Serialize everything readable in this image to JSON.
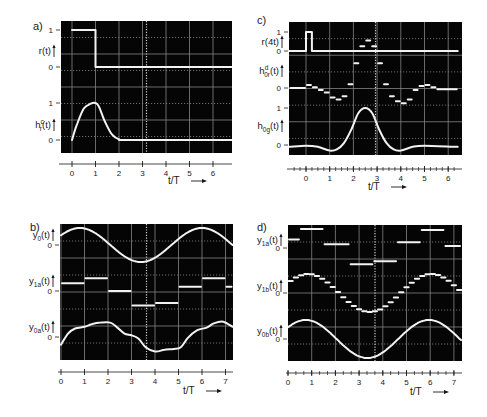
{
  "figure": {
    "background": "#ffffff",
    "screen_color": "#050505",
    "grid_color": "#9a9a9a",
    "trace_color": "#f2f2f2",
    "ink_color": "#1a1a1a"
  },
  "chart_data": [
    {
      "id": "a",
      "label": "a)",
      "type": "line",
      "xlabel": "t/T",
      "xticks": [
        0,
        1,
        2,
        3,
        4,
        5,
        6
      ],
      "xlim": [
        -0.5,
        6.8
      ],
      "traces": [
        {
          "name": "r(t)",
          "ylabel": "r(t)",
          "yticks": [
            "1",
            "0"
          ],
          "kind": "step",
          "points": [
            [
              0,
              1
            ],
            [
              1,
              1
            ],
            [
              1,
              0
            ],
            [
              6.8,
              0
            ]
          ]
        },
        {
          "name": "h_r^c(t)",
          "ylabel": "h",
          "ylabel_sub": "r",
          "ylabel_sup": "c",
          "ylabel_tail": "(t)",
          "yticks": [
            "1",
            "0"
          ],
          "kind": "smooth",
          "points": [
            [
              0,
              0
            ],
            [
              0.2,
              0.4
            ],
            [
              0.5,
              0.85
            ],
            [
              0.8,
              0.98
            ],
            [
              1.0,
              1.0
            ],
            [
              1.15,
              0.9
            ],
            [
              1.4,
              0.5
            ],
            [
              1.7,
              0.15
            ],
            [
              2.0,
              0.02
            ],
            [
              2.5,
              0
            ],
            [
              6.8,
              0
            ]
          ]
        }
      ]
    },
    {
      "id": "b",
      "label": "b)",
      "type": "line",
      "xlabel": "t/T",
      "xticks": [
        0,
        1,
        2,
        3,
        4,
        5,
        6,
        7
      ],
      "xlim": [
        0,
        7.3
      ],
      "traces": [
        {
          "name": "y_0(t)",
          "ylabel": "y",
          "ylabel_sub": "0",
          "ylabel_tail": "(t)",
          "yticks": [
            "0"
          ],
          "kind": "sine",
          "amplitude": 1.0,
          "period": 5.2,
          "phase_peak": 0.8
        },
        {
          "name": "y_1a(t)",
          "ylabel": "y",
          "ylabel_sub": "1a",
          "ylabel_tail": "(t)",
          "yticks": [
            "0"
          ],
          "kind": "segments",
          "segments": [
            [
              0,
              1,
              0.45
            ],
            [
              1,
              2,
              0.75
            ],
            [
              2,
              3,
              0.0
            ],
            [
              3,
              4,
              -0.85
            ],
            [
              4,
              5,
              -0.7
            ],
            [
              5,
              6,
              0.25
            ],
            [
              6,
              7,
              0.75
            ],
            [
              7,
              7.3,
              0.25
            ]
          ]
        },
        {
          "name": "y_0a(t)",
          "ylabel": "y",
          "ylabel_sub": "0a",
          "ylabel_tail": "(t)",
          "yticks": [
            "0"
          ],
          "kind": "smooth",
          "points": [
            [
              0,
              -0.45
            ],
            [
              0.3,
              0.2
            ],
            [
              0.6,
              0.5
            ],
            [
              1.0,
              0.6
            ],
            [
              1.3,
              0.75
            ],
            [
              1.7,
              0.85
            ],
            [
              2.1,
              0.85
            ],
            [
              2.4,
              0.55
            ],
            [
              2.7,
              0.2
            ],
            [
              3.0,
              0.1
            ],
            [
              3.3,
              -0.1
            ],
            [
              3.6,
              -0.6
            ],
            [
              4.0,
              -0.85
            ],
            [
              4.4,
              -0.75
            ],
            [
              4.8,
              -0.7
            ],
            [
              5.1,
              -0.6
            ],
            [
              5.4,
              -0.05
            ],
            [
              5.8,
              0.4
            ],
            [
              6.2,
              0.55
            ],
            [
              6.5,
              0.8
            ],
            [
              6.9,
              0.9
            ],
            [
              7.3,
              0.6
            ]
          ]
        }
      ]
    },
    {
      "id": "c",
      "label": "c)",
      "type": "line",
      "xlabel": "t/T",
      "xticks": [
        0,
        1,
        2,
        3,
        4,
        5,
        6
      ],
      "xminor_per_unit": 4,
      "xlim": [
        -0.7,
        6.4
      ],
      "traces": [
        {
          "name": "r(4t)",
          "ylabel": "r(4t)",
          "yticks": [
            "1",
            "0"
          ],
          "kind": "step",
          "points": [
            [
              -0.7,
              0
            ],
            [
              0,
              0
            ],
            [
              0,
              1
            ],
            [
              0.25,
              1
            ],
            [
              0.25,
              0
            ],
            [
              6.4,
              0
            ]
          ]
        },
        {
          "name": "h_0r^d(t)",
          "ylabel": "h",
          "ylabel_sub": "0r",
          "ylabel_sup": "d",
          "ylabel_tail": "(t)",
          "yticks": [
            "0"
          ],
          "kind": "segments",
          "segments": [
            [
              -0.7,
              0,
              0
            ],
            [
              0,
              0.25,
              0.08
            ],
            [
              0.25,
              0.5,
              0.02
            ],
            [
              0.5,
              0.75,
              -0.05
            ],
            [
              0.75,
              1.0,
              -0.12
            ],
            [
              1.0,
              1.25,
              -0.25
            ],
            [
              1.25,
              1.5,
              -0.3
            ],
            [
              1.5,
              1.75,
              -0.22
            ],
            [
              1.75,
              2.0,
              0.1
            ],
            [
              2.0,
              2.25,
              0.65
            ],
            [
              2.25,
              2.5,
              1.1
            ],
            [
              2.5,
              2.75,
              1.25
            ],
            [
              2.75,
              3.0,
              1.1
            ],
            [
              3.0,
              3.25,
              0.65
            ],
            [
              3.25,
              3.5,
              0.1
            ],
            [
              3.5,
              3.75,
              -0.22
            ],
            [
              3.75,
              4.0,
              -0.35
            ],
            [
              4.0,
              4.25,
              -0.4
            ],
            [
              4.25,
              4.5,
              -0.3
            ],
            [
              4.5,
              4.75,
              -0.05
            ],
            [
              4.75,
              5.0,
              0.05
            ],
            [
              5.0,
              5.25,
              0.08
            ],
            [
              5.25,
              5.5,
              0.02
            ],
            [
              5.5,
              6.4,
              -0.03
            ]
          ]
        },
        {
          "name": "h_0g(t)",
          "ylabel": "h",
          "ylabel_sub": "0g",
          "ylabel_tail": "(t)",
          "yticks": [
            "1",
            "0"
          ],
          "kind": "smooth",
          "points": [
            [
              -0.7,
              -0.05
            ],
            [
              0,
              -0.02
            ],
            [
              0.5,
              -0.05
            ],
            [
              1.0,
              -0.15
            ],
            [
              1.3,
              -0.12
            ],
            [
              1.6,
              0.05
            ],
            [
              1.9,
              0.4
            ],
            [
              2.2,
              0.85
            ],
            [
              2.5,
              1.0
            ],
            [
              2.8,
              0.85
            ],
            [
              3.1,
              0.4
            ],
            [
              3.4,
              0.05
            ],
            [
              3.7,
              -0.12
            ],
            [
              4.0,
              -0.15
            ],
            [
              4.5,
              -0.05
            ],
            [
              5.0,
              -0.02
            ],
            [
              6.4,
              -0.05
            ]
          ]
        }
      ]
    },
    {
      "id": "d",
      "label": "d)",
      "type": "line",
      "xlabel": "t/T",
      "xticks": [
        0,
        1,
        2,
        3,
        4,
        5,
        6,
        7
      ],
      "xminor_per_unit": 3,
      "xlim": [
        0,
        7.3
      ],
      "traces": [
        {
          "name": "y_1a(t)",
          "ylabel": "y",
          "ylabel_sub": "1a",
          "ylabel_tail": "(t)",
          "yticks": [
            "0"
          ],
          "kind": "segments",
          "segments": [
            [
              0,
              0.5,
              0.45
            ],
            [
              0.5,
              1.5,
              1.0
            ],
            [
              1.5,
              2.6,
              0.2
            ],
            [
              2.6,
              3.6,
              -0.85
            ],
            [
              3.6,
              4.6,
              -0.7
            ],
            [
              4.6,
              5.6,
              0.3
            ],
            [
              5.6,
              6.6,
              0.95
            ],
            [
              6.6,
              7.3,
              0.1
            ]
          ]
        },
        {
          "name": "y_1b(t)",
          "ylabel": "y",
          "ylabel_sub": "1b",
          "ylabel_tail": "(t)",
          "yticks": [
            "0"
          ],
          "kind": "staircase",
          "amplitude": 1.0,
          "period": 5.2,
          "phase_peak": 0.85,
          "step": 0.2222
        },
        {
          "name": "y_0b(t)",
          "ylabel": "y",
          "ylabel_sub": "0b",
          "ylabel_tail": "(t)",
          "yticks": [
            "0"
          ],
          "kind": "sine",
          "amplitude": 1.0,
          "period": 5.2,
          "phase_peak": 0.75
        }
      ]
    }
  ],
  "panels_layout": [
    {
      "id": "a",
      "screen": [
        61,
        21,
        232,
        153
      ],
      "axis_y": 164,
      "x0px": 72,
      "unit": 23.5,
      "rows": [
        {
          "zero": 67,
          "one": 30,
          "label_y": 51,
          "scale": 37
        },
        {
          "zero": 140,
          "one": 103,
          "label_y": 125,
          "scale": 37
        }
      ],
      "label_pos": [
        33,
        26
      ],
      "xlabel_pos": [
        168,
        184
      ],
      "arrow_x": 190
    },
    {
      "id": "b",
      "screen": [
        60,
        224,
        233,
        360
      ],
      "axis_y": 372,
      "x0px": 61,
      "unit": 23.5,
      "rows": [
        {
          "zero": 245,
          "label_y": 235,
          "scale": 17
        },
        {
          "zero": 291,
          "label_y": 281,
          "scale": 17
        },
        {
          "zero": 337,
          "label_y": 327,
          "scale": 17
        }
      ],
      "label_pos": [
        30,
        227
      ],
      "xlabel_pos": [
        183,
        394
      ],
      "arrow_x": 204
    },
    {
      "id": "c",
      "screen": [
        289,
        22,
        462,
        155
      ],
      "axis_y": 169,
      "x0px": 306,
      "unit": 23.7,
      "rows": [
        {
          "zero": 51,
          "one": 32,
          "label_y": 42,
          "scale": 19
        },
        {
          "zero": 88,
          "label_y": 71,
          "scale": 38
        },
        {
          "zero": 145,
          "one": 108,
          "label_y": 126,
          "scale": 37
        }
      ],
      "label_pos": [
        257,
        20
      ],
      "xlabel_pos": [
        368,
        190
      ],
      "arrow_x": 390
    },
    {
      "id": "d",
      "screen": [
        288,
        225,
        462,
        361
      ],
      "axis_y": 373,
      "x0px": 288,
      "unit": 23.7,
      "rows": [
        {
          "zero": 248,
          "label_y": 240,
          "scale": 19
        },
        {
          "zero": 293,
          "label_y": 286,
          "scale": 19
        },
        {
          "zero": 339,
          "label_y": 331,
          "scale": 19
        }
      ],
      "label_pos": [
        257,
        227
      ],
      "xlabel_pos": [
        410,
        395
      ],
      "arrow_x": 430
    }
  ]
}
